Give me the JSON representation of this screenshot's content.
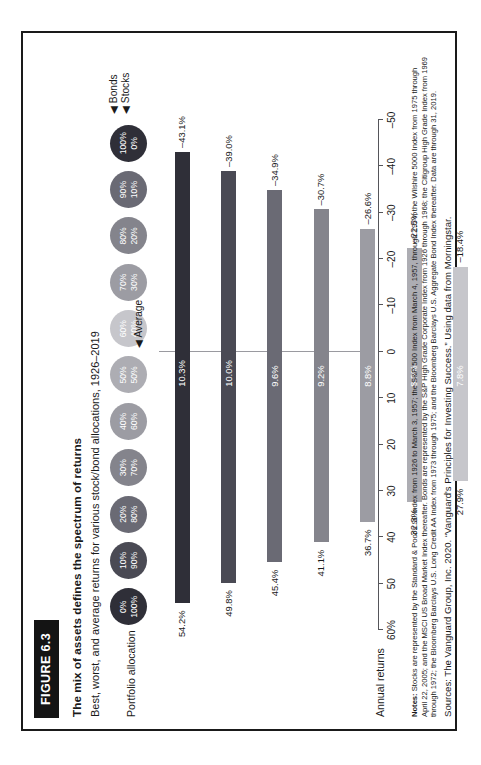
{
  "figure": {
    "tag": "FIGURE 6.3",
    "title": "The mix of assets defines the spectrum of returns",
    "subtitle": "Best, worst, and average returns for various stock/bond allocations, 1926–2019",
    "allocation_label": "Portfolio allocation",
    "axis_title": "Annual returns",
    "average_marker": "◀ Average",
    "legend": {
      "bonds": "◀ Bonds",
      "stocks": "◀ Stocks"
    }
  },
  "notes": {
    "label": "Notes:",
    "text": "Stocks are represented by the Standard & Poor's 90 Index from 1926 to March 3, 1957; the S&P 500 Index from March 4, 1957, through 1974; the Wilshire 5000 Index from 1975 through April 22, 2005; and the MSCI US Broad Market Index thereafter. Bonds are represented by the S&P High Grade Corporate Index from 1926 through 1968; the Citigroup High Grade Index from 1969 through 1972; the Bloomberg Barclays U.S. Long Credit AA Index from 1973 through 1975; and the Bloomberg Barclays U.S. Aggregate Bond Index thereafter. Data are through 31, 2019."
  },
  "source": "Sources: The Vanguard Group, Inc. 2020. “Vanguard's Principles for Investing Success.” Using data from Morningstar.",
  "chart_data": {
    "type": "bar",
    "title": "The mix of assets defines the spectrum of returns",
    "subtitle": "Best, worst, and average returns for various stock/bond allocations, 1926–2019",
    "xlabel": "Portfolio allocation",
    "ylabel": "Annual returns",
    "ylim": [
      -50,
      60
    ],
    "ytick_labels": [
      "60%",
      "50",
      "40",
      "30",
      "20",
      "10",
      "0",
      "–10",
      "–20",
      "–30",
      "–40",
      "–50"
    ],
    "ytick_values": [
      60,
      50,
      40,
      30,
      20,
      10,
      0,
      -10,
      -20,
      -30,
      -40,
      -50
    ],
    "grid": false,
    "legend_position": "top-right",
    "categories": [
      "100% stocks / 0% bonds",
      "90% stocks / 10% bonds",
      "80% stocks / 20% bonds",
      "70% stocks / 30% bonds",
      "60% stocks / 40% bonds",
      "50% stocks / 50% bonds",
      "40% stocks / 60% bonds",
      "30% stocks / 70% bonds",
      "20% stocks / 80% bonds",
      "10% stocks / 90% bonds",
      "0% stocks / 100% bonds"
    ],
    "allocations": [
      {
        "bonds": "0%",
        "stocks": "100%",
        "color": "#2f2f38"
      },
      {
        "bonds": "10%",
        "stocks": "90%",
        "color": "#4a4a54"
      },
      {
        "bonds": "20%",
        "stocks": "80%",
        "color": "#6a6a74"
      },
      {
        "bonds": "30%",
        "stocks": "70%",
        "color": "#84848c"
      },
      {
        "bonds": "40%",
        "stocks": "60%",
        "color": "#9c9ca3"
      },
      {
        "bonds": "50%",
        "stocks": "50%",
        "color": "#adadb3"
      },
      {
        "bonds": "60%",
        "stocks": "40%",
        "color": "#c6c6cb"
      },
      {
        "bonds": "70%",
        "stocks": "30%",
        "color": "#9c9ca3"
      },
      {
        "bonds": "80%",
        "stocks": "20%",
        "color": "#84848c"
      },
      {
        "bonds": "90%",
        "stocks": "10%",
        "color": "#6a6a74"
      },
      {
        "bonds": "100%",
        "stocks": "0%",
        "color": "#2f2f38"
      }
    ],
    "series": [
      {
        "name": "Best",
        "values": [
          54.2,
          49.8,
          45.4,
          41.1,
          36.7,
          32.3,
          27.9,
          28.4,
          29.8,
          31.2,
          32.6
        ],
        "labels": [
          "54.2%",
          "49.8%",
          "45.4%",
          "41.1%",
          "36.7%",
          "32.3%",
          "27.9%",
          "28.4%",
          "29.8%",
          "31.2%",
          "32.6%"
        ]
      },
      {
        "name": "Average",
        "values": [
          10.3,
          10.0,
          9.6,
          9.2,
          8.8,
          8.3,
          7.8,
          7.2,
          6.6,
          6.0,
          5.3
        ],
        "labels": [
          "10.3%",
          "10.0%",
          "9.6%",
          "9.2%",
          "8.8%",
          "8.3%",
          "7.8%",
          "7.2%",
          "6.6%",
          "6.0%",
          "5.3%"
        ]
      },
      {
        "name": "Worst",
        "values": [
          -43.1,
          -39.0,
          -34.9,
          -30.7,
          -26.6,
          -22.5,
          -18.4,
          -14.2,
          -10.1,
          -8.2,
          -8.1
        ],
        "labels": [
          "–43.1%",
          "–39.0%",
          "–34.9%",
          "–30.7%",
          "–26.6%",
          "–22.5%",
          "–18.4%",
          "–14.2%",
          "–10.1%",
          "–8.2%",
          "–8.1%"
        ]
      }
    ]
  }
}
